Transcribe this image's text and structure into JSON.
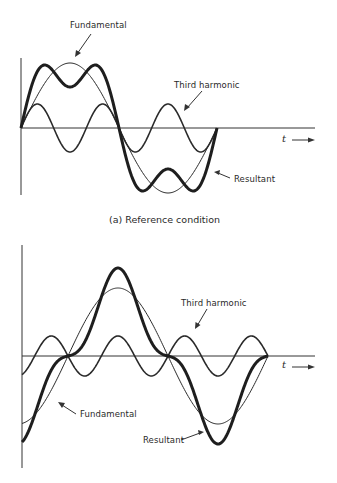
{
  "figure_a": {
    "caption": "(a)  Reference condition",
    "labels": {
      "fundamental": "Fundamental",
      "third_harmonic": "Third harmonic",
      "resultant": "Resultant",
      "time_axis": "t"
    }
  },
  "figure_b": {
    "caption": "",
    "labels": {
      "fundamental": "Fundamental",
      "third_harmonic": "Third harmonic",
      "resultant": "Resultant",
      "time_axis": "t"
    }
  },
  "chart_data": [
    {
      "type": "line",
      "title": "(a) Reference condition",
      "xlabel": "t",
      "ylabel": "",
      "grid": false,
      "x_range_cycles_of_fundamental": [
        0,
        1
      ],
      "series": [
        {
          "name": "Fundamental",
          "function": "sin(θ)",
          "amplitude": 1.0,
          "phase_deg": 0,
          "style": "thin"
        },
        {
          "name": "Third harmonic",
          "function": "0.37·sin(3θ)",
          "amplitude": 0.37,
          "phase_deg": 0,
          "style": "medium"
        },
        {
          "name": "Resultant",
          "function": "sin(θ) + 0.37·sin(3θ)",
          "style": "thick"
        }
      ]
    },
    {
      "type": "line",
      "title": "",
      "xlabel": "t",
      "ylabel": "",
      "grid": false,
      "x_range_cycles_of_fundamental": [
        -0.25,
        1.0
      ],
      "series": [
        {
          "name": "Fundamental",
          "function": "sin(θ)",
          "amplitude": 1.0,
          "phase_deg": 0,
          "style": "thin"
        },
        {
          "name": "Third harmonic",
          "function": "-0.3·sin(3θ)",
          "amplitude": 0.3,
          "phase_deg": 180,
          "style": "medium"
        },
        {
          "name": "Resultant",
          "function": "sin(θ) - 0.3·sin(3θ)",
          "style": "thick"
        }
      ]
    }
  ]
}
